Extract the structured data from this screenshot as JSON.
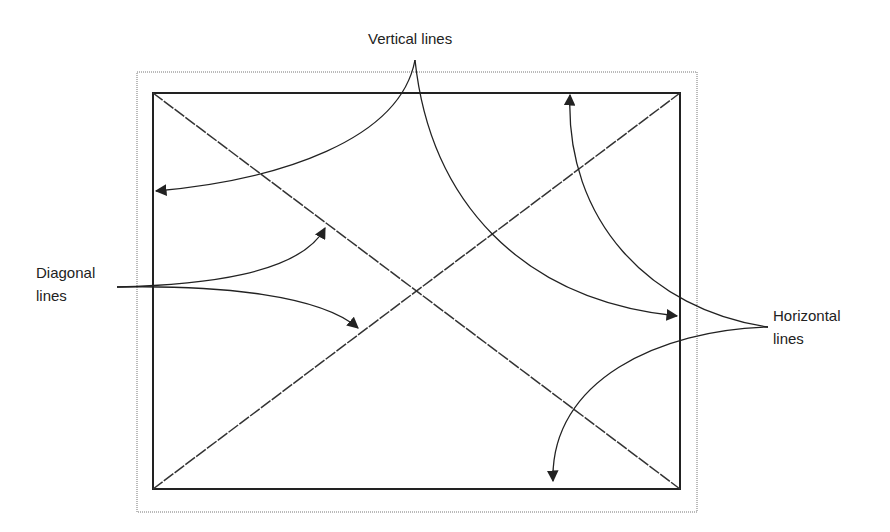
{
  "labels": {
    "vertical": "Vertical lines",
    "diagonal_1": "Diagonal",
    "diagonal_2": "lines",
    "horizontal_1": "Horizontal",
    "horizontal_2": "lines"
  },
  "colors": {
    "stroke": "#222222",
    "dotted": "#666666"
  }
}
